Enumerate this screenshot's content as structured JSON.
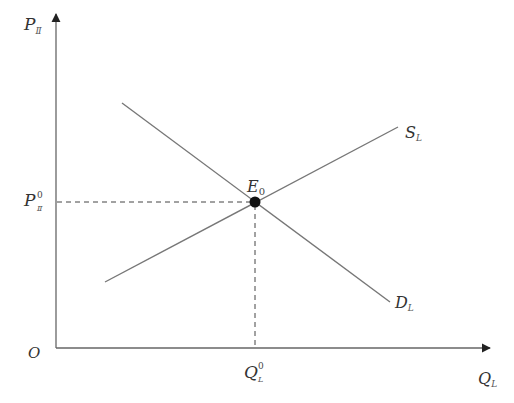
{
  "diagram": {
    "type": "supply-demand",
    "colors": {
      "axis": "#555555",
      "curve": "#777777",
      "dash": "#444444",
      "point": "#111111",
      "text": "#333333"
    },
    "axes": {
      "origin_label": "O",
      "y_label": {
        "main": "P",
        "sub": "Ⅱ"
      },
      "x_label": {
        "main": "Q",
        "sub": "L"
      }
    },
    "curves": [
      {
        "name": "supply",
        "label_main": "S",
        "label_sub": "L",
        "from": [
          105,
          282
        ],
        "to": [
          398,
          127
        ]
      },
      {
        "name": "demand",
        "label_main": "D",
        "label_sub": "L",
        "from": [
          122,
          103
        ],
        "to": [
          390,
          302
        ]
      }
    ],
    "equilibrium": {
      "label_main": "E",
      "label_sub": "0",
      "price_label": {
        "main": "P",
        "sub": "Ⅱ",
        "sup": "0"
      },
      "quantity_label": {
        "main": "Q",
        "sub": "L",
        "sup": "0"
      }
    }
  }
}
